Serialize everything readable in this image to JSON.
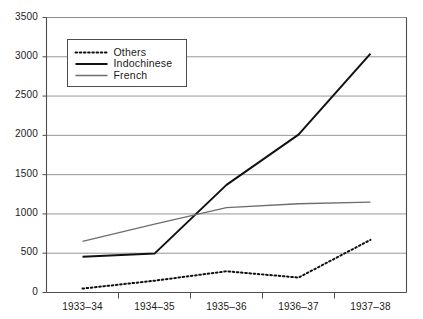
{
  "chart_data": {
    "type": "line",
    "title": "",
    "subtitle": "",
    "xlabel": "",
    "ylabel": "",
    "categories": [
      "1933–34",
      "1934–35",
      "1935–36",
      "1936–37",
      "1937–38"
    ],
    "ylim": [
      0,
      3500
    ],
    "yticks": [
      0,
      500,
      1000,
      1500,
      2000,
      2500,
      3000,
      3500
    ],
    "ytick_labels": [
      "0",
      "500",
      "1000",
      "1500",
      "2000",
      "2500",
      "3000",
      "3500"
    ],
    "grid": true,
    "grid_axis": "y",
    "legend_position": "upper-left",
    "series": [
      {
        "name": "Others",
        "style": "dotted",
        "color": "#111111",
        "values": [
          50,
          150,
          270,
          190,
          670
        ]
      },
      {
        "name": "Indochinese",
        "style": "solid-thick",
        "color": "#111111",
        "values": [
          455,
          495,
          1370,
          2010,
          3040
        ]
      },
      {
        "name": "French",
        "style": "solid-thin",
        "color": "#6e6e6e",
        "values": [
          650,
          870,
          1080,
          1130,
          1150
        ]
      }
    ]
  },
  "legend": {
    "items": [
      {
        "label": "Others",
        "swatch": "dotted-line-swatch"
      },
      {
        "label": "Indochinese",
        "swatch": "thick-line-swatch"
      },
      {
        "label": "French",
        "swatch": "gray-line-swatch"
      }
    ]
  },
  "colors": {
    "axis": "#4d4d4d",
    "grid": "#8a8a8a",
    "series_dark": "#111111",
    "series_gray": "#6e6e6e",
    "text": "#1a1a1a",
    "background": "#ffffff"
  }
}
